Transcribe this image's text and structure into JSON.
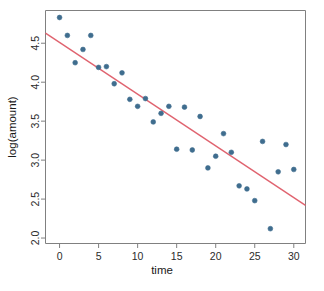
{
  "chart_data": {
    "type": "scatter",
    "title": "",
    "xlabel": "time",
    "ylabel": "log(amount)",
    "xlim": [
      -1.8,
      31.5
    ],
    "ylim": [
      1.93,
      4.92
    ],
    "grid": false,
    "legend": "none",
    "point_color": "#3f6d8e",
    "line_color": "#e0636f",
    "frame_color": "#808080",
    "xticks": [
      0,
      5,
      10,
      15,
      20,
      25,
      30
    ],
    "xtick_labels": [
      "0",
      "5",
      "10",
      "15",
      "20",
      "25",
      "30"
    ],
    "yticks": [
      2.0,
      2.5,
      3.0,
      3.5,
      4.0,
      4.5
    ],
    "ytick_labels": [
      "2.0",
      "2.5",
      "3.0",
      "3.5",
      "4.0",
      "4.5"
    ],
    "series": [
      {
        "name": "observations",
        "x": [
          0,
          1,
          2,
          3,
          4,
          5,
          6,
          7,
          8,
          9,
          10,
          11,
          12,
          13,
          14,
          15,
          16,
          17,
          18,
          19,
          20,
          21,
          22,
          23,
          24,
          25,
          26,
          27,
          28,
          29,
          30
        ],
        "y": [
          4.83,
          4.6,
          4.25,
          4.42,
          4.6,
          4.19,
          4.2,
          3.98,
          4.12,
          3.78,
          3.69,
          3.79,
          3.49,
          3.6,
          3.69,
          3.14,
          3.68,
          3.13,
          3.56,
          2.9,
          3.05,
          3.34,
          3.1,
          2.67,
          2.63,
          2.48,
          3.24,
          2.12,
          2.85,
          3.2,
          2.88
        ]
      }
    ],
    "fit_line": {
      "name": "least-squares fit",
      "x": [
        -1.8,
        31.5
      ],
      "y": [
        4.63,
        2.42
      ],
      "intercept": 4.516,
      "slope": -0.0663
    }
  },
  "axis_labels": {
    "x": "time",
    "y": "log(amount)"
  }
}
